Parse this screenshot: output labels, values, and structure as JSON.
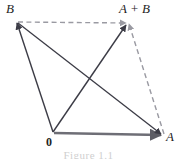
{
  "figure": {
    "type": "vector-addition-parallelogram",
    "caption": "Figure 1.1",
    "labels": {
      "origin": "0",
      "a": "A",
      "b": "B",
      "a_plus_b": "A + B"
    },
    "colors": {
      "solid_line": "#3c3c46",
      "dashed_line": "#9a9aa2",
      "base_vector": "#6e6e76",
      "text": "#242424",
      "background": "#ffffff"
    },
    "points": {
      "origin": {
        "x": 53,
        "y": 133
      },
      "a": {
        "x": 163,
        "y": 136
      },
      "b": {
        "x": 16,
        "y": 21
      },
      "a_plus_b": {
        "x": 127,
        "y": 22
      }
    },
    "edges": [
      {
        "name": "vector-OA",
        "from": "origin",
        "to": "a",
        "style": "solid",
        "arrow": true
      },
      {
        "name": "vector-OB",
        "from": "origin",
        "to": "b",
        "style": "solid",
        "arrow": true
      },
      {
        "name": "vector-O-to-ApB",
        "from": "origin",
        "to": "a_plus_b",
        "style": "solid",
        "arrow": true
      },
      {
        "name": "vector-BA",
        "from": "b",
        "to": "a",
        "style": "solid",
        "arrow": true
      },
      {
        "name": "side-B-to-ApB",
        "from": "b",
        "to": "a_plus_b",
        "style": "dashed",
        "arrow": false
      },
      {
        "name": "side-A-to-ApB",
        "from": "a",
        "to": "a_plus_b",
        "style": "dashed",
        "arrow": false
      }
    ]
  }
}
